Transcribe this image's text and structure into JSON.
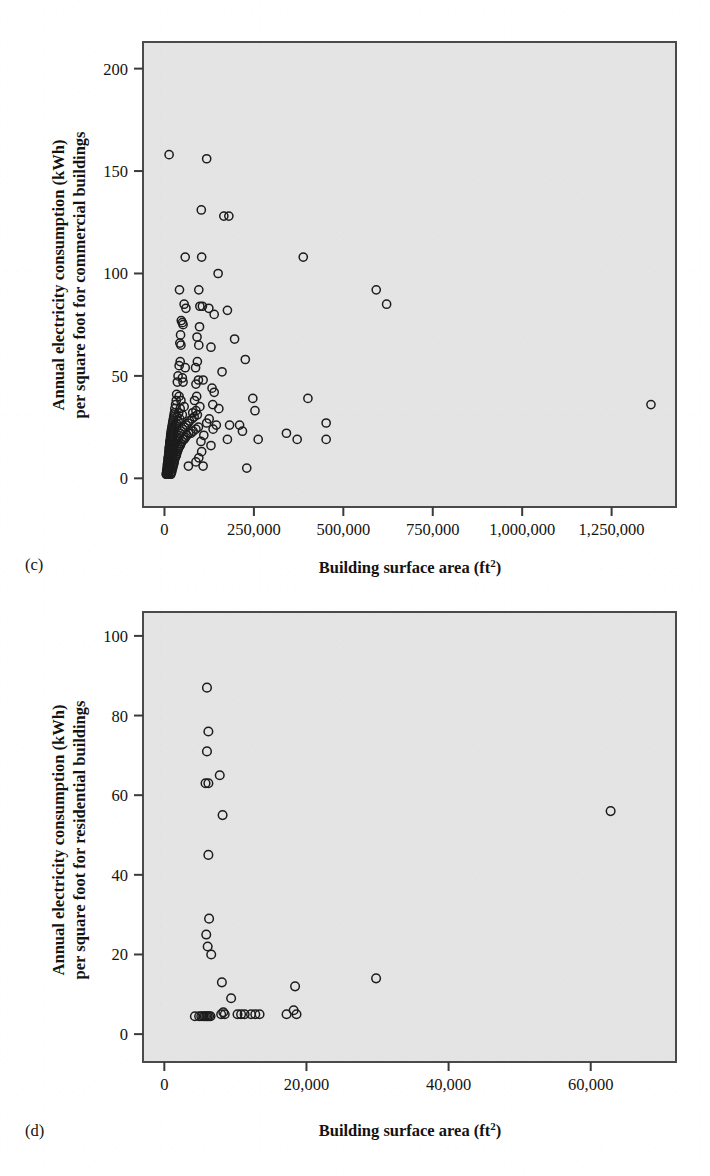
{
  "figure": {
    "background_color": "#ffffff",
    "plot_background_color": "#e4e4e4",
    "plot_border_color": "#4a4a4a",
    "marker_color": "#1c1c1c",
    "panels": [
      {
        "id": "c",
        "panel_label": "(c)",
        "ylabel_line1": "Annual electricity consumption (kWh)",
        "ylabel_line2": "per square foot for commercial buildings",
        "xlabel_text": "Building surface area (ft",
        "xlabel_sup": "2",
        "xlabel_tail": ")",
        "xticks": [
          "0",
          "250,000",
          "500,000",
          "750,000",
          "1,000,000",
          "1,250,000"
        ],
        "yticks": [
          "0",
          "50",
          "100",
          "150",
          "200"
        ]
      },
      {
        "id": "d",
        "panel_label": "(d)",
        "ylabel_line1": "Annual electricity consumption (kWh)",
        "ylabel_line2": "per square foot for residential buildings",
        "xlabel_text": "Building surface area (ft",
        "xlabel_sup": "2",
        "xlabel_tail": ")",
        "xticks": [
          "0",
          "20,000",
          "40,000",
          "60,000"
        ],
        "yticks": [
          "0",
          "20",
          "40",
          "60",
          "80",
          "100"
        ]
      }
    ]
  },
  "chart_data": [
    {
      "type": "scatter",
      "panel": "(c)",
      "title": "",
      "xlabel": "Building surface area (ft2)",
      "ylabel": "Annual electricity consumption (kWh) per square foot for commercial buildings",
      "xlim": [
        -60000,
        1430000
      ],
      "ylim": [
        -14,
        213
      ],
      "xticks": [
        0,
        250000,
        500000,
        750000,
        1000000,
        1250000
      ],
      "yticks": [
        0,
        50,
        100,
        150,
        200
      ],
      "grid": false,
      "legend": false,
      "marker": "open-circle",
      "points": [
        [
          13000,
          158
        ],
        [
          118000,
          156
        ],
        [
          103000,
          131
        ],
        [
          166000,
          128
        ],
        [
          180000,
          128
        ],
        [
          58000,
          108
        ],
        [
          104000,
          108
        ],
        [
          388000,
          108
        ],
        [
          150000,
          100
        ],
        [
          42000,
          92
        ],
        [
          96000,
          92
        ],
        [
          592000,
          92
        ],
        [
          621000,
          85
        ],
        [
          55000,
          85
        ],
        [
          99000,
          84
        ],
        [
          106000,
          84
        ],
        [
          60000,
          83
        ],
        [
          124000,
          83
        ],
        [
          139000,
          80
        ],
        [
          176000,
          82
        ],
        [
          47000,
          77
        ],
        [
          50000,
          76
        ],
        [
          52000,
          75
        ],
        [
          98000,
          74
        ],
        [
          45000,
          70
        ],
        [
          91000,
          69
        ],
        [
          196000,
          68
        ],
        [
          43000,
          66
        ],
        [
          46000,
          65
        ],
        [
          96000,
          65
        ],
        [
          130000,
          64
        ],
        [
          226000,
          58
        ],
        [
          44000,
          57
        ],
        [
          92000,
          57
        ],
        [
          41000,
          55
        ],
        [
          87000,
          54
        ],
        [
          58000,
          54
        ],
        [
          161000,
          52
        ],
        [
          38000,
          50
        ],
        [
          50000,
          49
        ],
        [
          95000,
          48
        ],
        [
          108000,
          48
        ],
        [
          36000,
          47
        ],
        [
          52000,
          47
        ],
        [
          88000,
          46
        ],
        [
          133000,
          44
        ],
        [
          139000,
          42
        ],
        [
          34000,
          41
        ],
        [
          41000,
          40
        ],
        [
          90000,
          40
        ],
        [
          247000,
          39
        ],
        [
          401000,
          39
        ],
        [
          33000,
          38
        ],
        [
          46000,
          38
        ],
        [
          84000,
          38
        ],
        [
          135000,
          36
        ],
        [
          1360000,
          36
        ],
        [
          31000,
          36
        ],
        [
          55000,
          35
        ],
        [
          99000,
          35
        ],
        [
          152000,
          34
        ],
        [
          29000,
          34
        ],
        [
          44000,
          34
        ],
        [
          88000,
          33
        ],
        [
          253000,
          33
        ],
        [
          28000,
          32
        ],
        [
          40000,
          32
        ],
        [
          79000,
          32
        ],
        [
          27000,
          31
        ],
        [
          50000,
          31
        ],
        [
          92000,
          31
        ],
        [
          26000,
          30
        ],
        [
          35000,
          30
        ],
        [
          83000,
          30
        ],
        [
          125000,
          29
        ],
        [
          25000,
          29
        ],
        [
          43000,
          29
        ],
        [
          77000,
          29
        ],
        [
          24000,
          28
        ],
        [
          38000,
          28
        ],
        [
          70000,
          28
        ],
        [
          118000,
          27
        ],
        [
          23000,
          27
        ],
        [
          33000,
          27
        ],
        [
          66000,
          27
        ],
        [
          145000,
          26
        ],
        [
          182000,
          26
        ],
        [
          210000,
          26
        ],
        [
          452000,
          27
        ],
        [
          22000,
          26
        ],
        [
          30000,
          26
        ],
        [
          61000,
          26
        ],
        [
          95000,
          25
        ],
        [
          21000,
          25
        ],
        [
          28000,
          25
        ],
        [
          56000,
          25
        ],
        [
          88000,
          24
        ],
        [
          136000,
          24
        ],
        [
          20000,
          24
        ],
        [
          26000,
          24
        ],
        [
          51000,
          24
        ],
        [
          80000,
          23
        ],
        [
          218000,
          23
        ],
        [
          19000,
          23
        ],
        [
          25000,
          23
        ],
        [
          47000,
          23
        ],
        [
          74000,
          22
        ],
        [
          341000,
          22
        ],
        [
          18500,
          22
        ],
        [
          24000,
          22
        ],
        [
          44000,
          22
        ],
        [
          68000,
          22
        ],
        [
          18000,
          21
        ],
        [
          23000,
          21
        ],
        [
          41000,
          21
        ],
        [
          63000,
          21
        ],
        [
          110000,
          21
        ],
        [
          17500,
          21
        ],
        [
          22000,
          20
        ],
        [
          38000,
          20
        ],
        [
          59000,
          20
        ],
        [
          176000,
          19
        ],
        [
          17000,
          20
        ],
        [
          21000,
          20
        ],
        [
          36000,
          20
        ],
        [
          55000,
          19
        ],
        [
          262000,
          19
        ],
        [
          371000,
          19
        ],
        [
          452000,
          19
        ],
        [
          16500,
          19
        ],
        [
          20000,
          19
        ],
        [
          34000,
          19
        ],
        [
          52000,
          19
        ],
        [
          16000,
          18
        ],
        [
          19500,
          18
        ],
        [
          32000,
          18
        ],
        [
          49000,
          18
        ],
        [
          102000,
          18
        ],
        [
          15500,
          18
        ],
        [
          19000,
          17
        ],
        [
          30000,
          17
        ],
        [
          46000,
          17
        ],
        [
          15000,
          17
        ],
        [
          18500,
          17
        ],
        [
          28000,
          17
        ],
        [
          44000,
          16
        ],
        [
          130000,
          16
        ],
        [
          14500,
          16
        ],
        [
          18000,
          16
        ],
        [
          27000,
          16
        ],
        [
          42000,
          16
        ],
        [
          14000,
          15
        ],
        [
          17500,
          15
        ],
        [
          26000,
          15
        ],
        [
          40000,
          15
        ],
        [
          13500,
          15
        ],
        [
          17000,
          14
        ],
        [
          25000,
          14
        ],
        [
          38000,
          14
        ],
        [
          13000,
          14
        ],
        [
          16500,
          14
        ],
        [
          24000,
          13
        ],
        [
          36000,
          13
        ],
        [
          104000,
          13
        ],
        [
          12500,
          13
        ],
        [
          16000,
          13
        ],
        [
          23000,
          12
        ],
        [
          34000,
          12
        ],
        [
          12000,
          12
        ],
        [
          15500,
          12
        ],
        [
          22000,
          12
        ],
        [
          33000,
          11
        ],
        [
          11500,
          11
        ],
        [
          15000,
          11
        ],
        [
          21000,
          11
        ],
        [
          31000,
          11
        ],
        [
          96000,
          10
        ],
        [
          11000,
          10
        ],
        [
          14500,
          10
        ],
        [
          20000,
          10
        ],
        [
          30000,
          10
        ],
        [
          10500,
          10
        ],
        [
          14000,
          9
        ],
        [
          19000,
          9
        ],
        [
          28000,
          9
        ],
        [
          10000,
          9
        ],
        [
          13500,
          9
        ],
        [
          18000,
          8
        ],
        [
          27000,
          8
        ],
        [
          88000,
          8
        ],
        [
          9500,
          8
        ],
        [
          13000,
          8
        ],
        [
          17000,
          8
        ],
        [
          26000,
          7
        ],
        [
          9000,
          7
        ],
        [
          12500,
          7
        ],
        [
          16000,
          7
        ],
        [
          25000,
          7
        ],
        [
          67000,
          6
        ],
        [
          8500,
          7
        ],
        [
          12000,
          6
        ],
        [
          15000,
          6
        ],
        [
          24000,
          6
        ],
        [
          108000,
          6
        ],
        [
          8000,
          6
        ],
        [
          11500,
          6
        ],
        [
          14000,
          5
        ],
        [
          23000,
          5
        ],
        [
          7500,
          5
        ],
        [
          11000,
          5
        ],
        [
          13000,
          5
        ],
        [
          22000,
          5
        ],
        [
          230000,
          5
        ],
        [
          7000,
          4
        ],
        [
          10500,
          4
        ],
        [
          12500,
          4
        ],
        [
          21000,
          4
        ],
        [
          6500,
          4
        ],
        [
          10000,
          4
        ],
        [
          12000,
          3
        ],
        [
          20000,
          3
        ],
        [
          6000,
          3
        ],
        [
          9500,
          3
        ],
        [
          11500,
          3
        ],
        [
          19000,
          3
        ],
        [
          5500,
          2
        ],
        [
          9000,
          2
        ],
        [
          11000,
          2
        ],
        [
          18000,
          2
        ],
        [
          5000,
          2
        ],
        [
          8500,
          2
        ],
        [
          10500,
          2
        ],
        [
          17000,
          2
        ]
      ]
    },
    {
      "type": "scatter",
      "panel": "(d)",
      "title": "",
      "xlabel": "Building surface area (ft2)",
      "ylabel": "Annual electricity consumption (kWh) per square foot for residential buildings",
      "xlim": [
        -3000,
        72000
      ],
      "ylim": [
        -7,
        106
      ],
      "xticks": [
        0,
        20000,
        40000,
        60000
      ],
      "yticks": [
        0,
        20,
        40,
        60,
        80,
        100
      ],
      "grid": false,
      "legend": false,
      "marker": "open-circle",
      "points": [
        [
          6000,
          87
        ],
        [
          6200,
          76
        ],
        [
          6000,
          71
        ],
        [
          7800,
          65
        ],
        [
          5800,
          63
        ],
        [
          6200,
          63
        ],
        [
          8200,
          55
        ],
        [
          62800,
          56
        ],
        [
          6200,
          45
        ],
        [
          6300,
          29
        ],
        [
          5900,
          25
        ],
        [
          6100,
          22
        ],
        [
          6600,
          20
        ],
        [
          8100,
          13
        ],
        [
          18400,
          12
        ],
        [
          29800,
          14
        ],
        [
          9400,
          9
        ],
        [
          4300,
          4.5
        ],
        [
          4900,
          4.5
        ],
        [
          5200,
          4.5
        ],
        [
          5500,
          4.5
        ],
        [
          5700,
          4.5
        ],
        [
          5900,
          4.5
        ],
        [
          6100,
          4.5
        ],
        [
          6300,
          4.5
        ],
        [
          6500,
          4.5
        ],
        [
          8000,
          5
        ],
        [
          8300,
          5.5
        ],
        [
          8500,
          5
        ],
        [
          10300,
          5
        ],
        [
          10800,
          5
        ],
        [
          11300,
          5
        ],
        [
          12200,
          5
        ],
        [
          12800,
          5
        ],
        [
          13400,
          5
        ],
        [
          17200,
          5
        ],
        [
          18200,
          6
        ],
        [
          18600,
          5
        ]
      ]
    }
  ]
}
